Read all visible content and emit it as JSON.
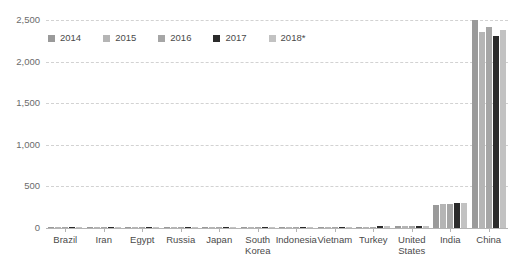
{
  "chart_data": {
    "type": "bar",
    "title": "",
    "subtitle": "",
    "xlabel": "",
    "ylabel": "",
    "ylim": [
      0,
      2500
    ],
    "yticks": [
      0,
      500,
      1000,
      1500,
      2000,
      2500
    ],
    "ytick_labels": [
      "0",
      "500",
      "1,000",
      "1,500",
      "2,000",
      "2,500"
    ],
    "grid": true,
    "legend_position": "top-left",
    "categories": [
      "Brazil",
      "Iran",
      "Egypt",
      "Russia",
      "Japan",
      "South Korea",
      "Indonesia",
      "Vietnam",
      "Turkey",
      "United States",
      "India",
      "China"
    ],
    "series": [
      {
        "name": "2014",
        "color": "#9a9a9a",
        "values": [
          12,
          15,
          11,
          10,
          14,
          13,
          14,
          13,
          17,
          20,
          280,
          2500
        ]
      },
      {
        "name": "2015",
        "color": "#b5b5b5",
        "values": [
          12,
          15,
          11,
          11,
          14,
          13,
          14,
          14,
          17,
          21,
          285,
          2350
        ]
      },
      {
        "name": "2016",
        "color": "#a6a6a6",
        "values": [
          13,
          16,
          12,
          11,
          14,
          13,
          15,
          15,
          18,
          22,
          290,
          2420
        ]
      },
      {
        "name": "2017",
        "color": "#2b2b2b",
        "values": [
          13,
          17,
          13,
          12,
          15,
          14,
          16,
          16,
          19,
          23,
          295,
          2310
        ]
      },
      {
        "name": "2018*",
        "color": "#c2c2c2",
        "values": [
          13,
          17,
          13,
          12,
          15,
          14,
          16,
          17,
          20,
          24,
          300,
          2380
        ]
      }
    ]
  }
}
